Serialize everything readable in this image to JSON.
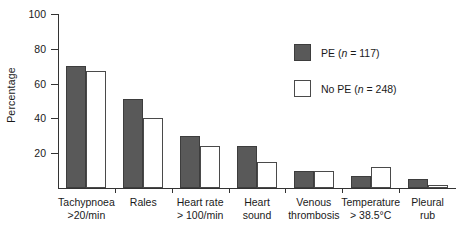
{
  "chart_data": {
    "type": "bar",
    "title": "",
    "xlabel": "",
    "ylabel": "Percentage",
    "ylim": [
      0,
      100
    ],
    "yticks": [
      0,
      20,
      40,
      60,
      80,
      100
    ],
    "ytick_labels": [
      "",
      "20",
      "40",
      "60",
      "80",
      "100"
    ],
    "grid": false,
    "legend_position": "upper right",
    "categories": [
      "Tachypnoea >20/min",
      "Rales",
      "Heart rate > 100/min",
      "Heart sound",
      "Venous thrombosis",
      "Temperature > 38.5°C",
      "Pleural rub"
    ],
    "category_lines": [
      [
        "Tachypnoea",
        ">20/min"
      ],
      [
        "Rales",
        ""
      ],
      [
        "Heart rate",
        "> 100/min"
      ],
      [
        "Heart",
        "sound"
      ],
      [
        "Venous",
        "thrombosis"
      ],
      [
        "Temperature",
        "> 38.5°C"
      ],
      [
        "Pleural",
        "rub"
      ]
    ],
    "series": [
      {
        "name": "PE (n = 117)",
        "label_prefix": "PE (",
        "label_italic": "n",
        "label_suffix": " = 117)",
        "color": "#595959",
        "values": [
          70,
          51,
          30,
          24,
          10,
          7,
          5
        ]
      },
      {
        "name": "No PE (n = 248)",
        "label_prefix": "No PE (",
        "label_italic": "n",
        "label_suffix": " = 248)",
        "color": "#ffffff",
        "values": [
          67,
          40,
          24,
          15,
          10,
          12,
          2
        ]
      }
    ]
  }
}
